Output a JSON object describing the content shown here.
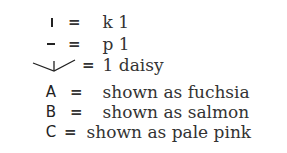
{
  "legend": {
    "rows": [
      {
        "symbol": "|",
        "symbol_name": "vertical-bar",
        "equals": "=",
        "text": "k 1"
      },
      {
        "symbol": "–",
        "symbol_name": "dash",
        "equals": "=",
        "text": "p 1"
      },
      {
        "symbol": "daisy-stitch",
        "symbol_name": "daisy",
        "equals": "=",
        "text": "1 daisy"
      },
      {
        "symbol": "A",
        "symbol_name": "letter-a",
        "equals": "=",
        "text": "shown as fuchsia"
      },
      {
        "symbol": "B",
        "symbol_name": "letter-b",
        "equals": "=",
        "text": "shown as salmon"
      },
      {
        "symbol": "C",
        "symbol_name": "letter-c",
        "equals": "=",
        "text": "shown as pale pink"
      }
    ]
  }
}
